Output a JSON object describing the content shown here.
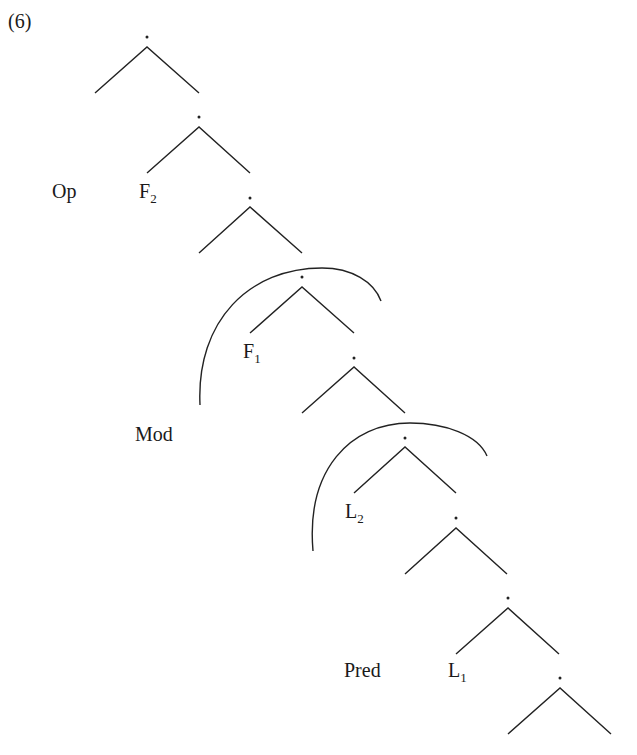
{
  "example_number": "(6)",
  "labels": {
    "op": "Op",
    "f2_base": "F",
    "f2_sub": "2",
    "f1_base": "F",
    "f1_sub": "1",
    "mod": "Mod",
    "l2_base": "L",
    "l2_sub": "2",
    "pred": "Pred",
    "l1_base": "L",
    "l1_sub": "1"
  },
  "node_marker": "·",
  "tree": {
    "type": "right-branching binary tree",
    "node_count": 9,
    "arcs": [
      {
        "name": "mod-arc",
        "spans": "node 4 subtree",
        "label": "Mod"
      },
      {
        "name": "lower-arc",
        "spans": "node 6 subtree"
      }
    ]
  },
  "colors": {
    "ink": "#222222",
    "background": "#ffffff"
  }
}
